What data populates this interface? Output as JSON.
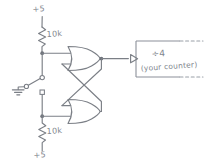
{
  "diagram": {
    "stroke_color": "#7b7f86",
    "background_color": "#ffffff",
    "labels": {
      "supply_top": "+5",
      "supply_bottom": "+5",
      "resistor_top": "10k",
      "resistor_bottom": "10k",
      "counter_divider": "÷4",
      "counter_caption": "(your counter)"
    },
    "components": [
      {
        "name": "pullup-resistor-top",
        "type": "resistor",
        "value": "10k"
      },
      {
        "name": "pullup-resistor-bottom",
        "type": "resistor",
        "value": "10k"
      },
      {
        "name": "spdt-switch",
        "type": "switch",
        "poles": 2
      },
      {
        "name": "ground-symbol",
        "type": "ground"
      },
      {
        "name": "nor-gate-top",
        "type": "nor-gate",
        "inputs": 2
      },
      {
        "name": "nor-gate-bottom",
        "type": "nor-gate",
        "inputs": 2
      },
      {
        "name": "counter-block",
        "type": "block",
        "label": "÷4"
      }
    ]
  }
}
